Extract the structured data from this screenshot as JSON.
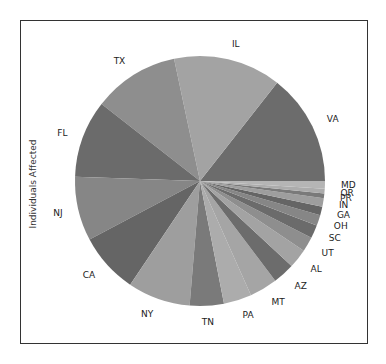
{
  "chart_data": {
    "type": "pie",
    "title": "",
    "ylabel": "Individuals Affected",
    "start_angle_deg": 0,
    "direction": "counterclockwise",
    "categories": [
      "VA",
      "IL",
      "TX",
      "FL",
      "NJ",
      "CA",
      "NY",
      "TN",
      "PA",
      "MT",
      "AZ",
      "AL",
      "UT",
      "SC",
      "OH",
      "GA",
      "IN",
      "PR",
      "OR",
      "MD"
    ],
    "values": [
      14.4,
      13.9,
      11.1,
      10.0,
      8.3,
      7.8,
      8.1,
      4.4,
      3.6,
      3.6,
      2.8,
      2.5,
      1.9,
      1.7,
      1.4,
      1.1,
      1.1,
      0.6,
      0.6,
      1.0
    ],
    "value_unit": "percent of total (estimated from slice angles)",
    "colors": [
      "#6c6c6c",
      "#a3a3a3",
      "#8e8e8e",
      "#6b6b6b",
      "#868686",
      "#656565",
      "#9e9e9e",
      "#7a7a7a",
      "#acacac",
      "#a5a5a5",
      "#6c6c6c",
      "#a3a3a3",
      "#8e8e8e",
      "#6b6b6b",
      "#868686",
      "#656565",
      "#9e9e9e",
      "#7a7a7a",
      "#acacac",
      "#b5b5b5"
    ],
    "legend": null,
    "grid": false
  },
  "figure": {
    "ylabel": "Individuals Affected"
  }
}
